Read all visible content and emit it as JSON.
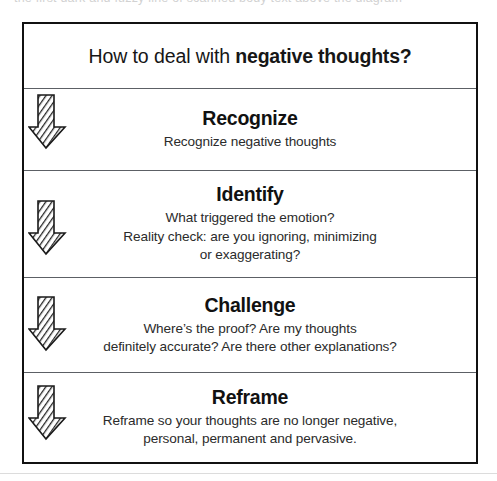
{
  "page": {
    "scan_artifact_top_text": "the first dark and fuzzy line of scanned body text above the diagram",
    "title_prefix": "How to deal with ",
    "title_emphasis": "negative thoughts?",
    "border_color": "#111111",
    "divider_color": "#5c6065",
    "background_color": "#ffffff",
    "text_color": "#1a1a1a"
  },
  "steps": [
    {
      "heading": "Recognize",
      "lines": [
        "Recognize negative thoughts"
      ]
    },
    {
      "heading": "Identify",
      "lines": [
        "What triggered the emotion?",
        "Reality check: are you ignoring, minimizing",
        "or exaggerating?"
      ]
    },
    {
      "heading": "Challenge",
      "lines": [
        "Where’s the proof? Are my thoughts",
        "definitely accurate? Are there other explanations?"
      ]
    },
    {
      "heading": "Reframe",
      "lines": [
        "Reframe so your thoughts are no longer negative,",
        "personal, permanent and pervasive."
      ]
    }
  ],
  "arrows": [
    {
      "name": "down-arrow-icon",
      "after_step": "Recognize"
    },
    {
      "name": "down-arrow-icon",
      "after_step": "Identify"
    },
    {
      "name": "down-arrow-icon",
      "after_step": "Challenge"
    },
    {
      "name": "down-arrow-icon",
      "after_step": "Reframe"
    }
  ]
}
